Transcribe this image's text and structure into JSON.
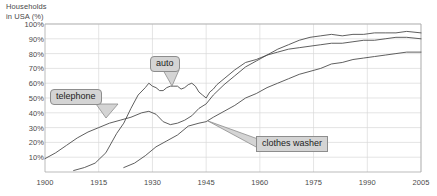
{
  "chart_data": {
    "type": "line",
    "title": "Households\nin USA (%)",
    "ylabel": "Households in USA (%)",
    "xlabel": "",
    "xlim": [
      1900,
      2005
    ],
    "ylim": [
      0,
      100
    ],
    "grid": true,
    "legend_position": "inline-callouts",
    "y_ticks": [
      "10%",
      "20%",
      "30%",
      "40%",
      "50%",
      "60%",
      "70%",
      "80%",
      "90%",
      "100%"
    ],
    "y_tick_values": [
      10,
      20,
      30,
      40,
      50,
      60,
      70,
      80,
      90,
      100
    ],
    "x_ticks": [
      "1900",
      "1915",
      "1930",
      "1945",
      "1960",
      "1975",
      "1990",
      "2005"
    ],
    "x_tick_values": [
      1900,
      1915,
      1930,
      1945,
      1960,
      1975,
      1990,
      2005
    ],
    "annotations": [
      {
        "label": "telephone",
        "series": "telephone",
        "point_x": 1925,
        "point_y": 38
      },
      {
        "label": "auto",
        "series": "auto",
        "point_x": 1937,
        "point_y": 56
      },
      {
        "label": "clothes washer",
        "series": "clothes washer",
        "point_x": 1965,
        "point_y": 50
      }
    ],
    "series": [
      {
        "name": "telephone",
        "color": "#4d4d4d",
        "points": [
          [
            1900,
            9
          ],
          [
            1903,
            13
          ],
          [
            1906,
            18
          ],
          [
            1909,
            23
          ],
          [
            1912,
            27
          ],
          [
            1915,
            30
          ],
          [
            1918,
            33
          ],
          [
            1921,
            35
          ],
          [
            1924,
            37
          ],
          [
            1927,
            40
          ],
          [
            1929,
            41
          ],
          [
            1931,
            39
          ],
          [
            1933,
            34
          ],
          [
            1935,
            32
          ],
          [
            1937,
            33
          ],
          [
            1939,
            35
          ],
          [
            1941,
            38
          ],
          [
            1943,
            43
          ],
          [
            1945,
            46
          ],
          [
            1947,
            52
          ],
          [
            1950,
            59
          ],
          [
            1953,
            65
          ],
          [
            1956,
            71
          ],
          [
            1959,
            75
          ],
          [
            1962,
            79
          ],
          [
            1965,
            83
          ],
          [
            1968,
            86
          ],
          [
            1971,
            89
          ],
          [
            1974,
            91
          ],
          [
            1977,
            92
          ],
          [
            1980,
            93
          ],
          [
            1983,
            92
          ],
          [
            1986,
            93
          ],
          [
            1989,
            93
          ],
          [
            1992,
            94
          ],
          [
            1995,
            94
          ],
          [
            1998,
            94
          ],
          [
            2001,
            95
          ],
          [
            2005,
            94
          ]
        ]
      },
      {
        "name": "auto",
        "color": "#4d4d4d",
        "points": [
          [
            1908,
            1
          ],
          [
            1911,
            3
          ],
          [
            1914,
            6
          ],
          [
            1917,
            13
          ],
          [
            1920,
            26
          ],
          [
            1922,
            33
          ],
          [
            1924,
            43
          ],
          [
            1926,
            52
          ],
          [
            1928,
            57
          ],
          [
            1929,
            60
          ],
          [
            1930,
            58
          ],
          [
            1931,
            57
          ],
          [
            1932,
            55
          ],
          [
            1933,
            55
          ],
          [
            1934,
            57
          ],
          [
            1935,
            58
          ],
          [
            1936,
            58
          ],
          [
            1937,
            58
          ],
          [
            1938,
            56
          ],
          [
            1939,
            57
          ],
          [
            1940,
            59
          ],
          [
            1941,
            60
          ],
          [
            1942,
            58
          ],
          [
            1943,
            54
          ],
          [
            1944,
            52
          ],
          [
            1945,
            50
          ],
          [
            1946,
            54
          ],
          [
            1947,
            56
          ],
          [
            1948,
            59
          ],
          [
            1950,
            63
          ],
          [
            1953,
            69
          ],
          [
            1956,
            74
          ],
          [
            1959,
            76
          ],
          [
            1962,
            79
          ],
          [
            1965,
            81
          ],
          [
            1968,
            83
          ],
          [
            1971,
            84
          ],
          [
            1974,
            85
          ],
          [
            1977,
            86
          ],
          [
            1980,
            87
          ],
          [
            1983,
            87
          ],
          [
            1986,
            88
          ],
          [
            1989,
            89
          ],
          [
            1992,
            89
          ],
          [
            1995,
            90
          ],
          [
            1998,
            91
          ],
          [
            2001,
            91
          ],
          [
            2005,
            90
          ]
        ]
      },
      {
        "name": "clothes washer",
        "color": "#4d4d4d",
        "points": [
          [
            1922,
            3
          ],
          [
            1925,
            6
          ],
          [
            1928,
            11
          ],
          [
            1931,
            17
          ],
          [
            1934,
            21
          ],
          [
            1937,
            25
          ],
          [
            1940,
            31
          ],
          [
            1943,
            33
          ],
          [
            1945,
            34
          ],
          [
            1947,
            37
          ],
          [
            1950,
            41
          ],
          [
            1953,
            45
          ],
          [
            1956,
            50
          ],
          [
            1959,
            53
          ],
          [
            1962,
            57
          ],
          [
            1965,
            60
          ],
          [
            1968,
            63
          ],
          [
            1971,
            66
          ],
          [
            1974,
            68
          ],
          [
            1977,
            70
          ],
          [
            1980,
            73
          ],
          [
            1983,
            74
          ],
          [
            1986,
            76
          ],
          [
            1989,
            77
          ],
          [
            1992,
            78
          ],
          [
            1995,
            79
          ],
          [
            1998,
            80
          ],
          [
            2001,
            81
          ],
          [
            2005,
            81
          ]
        ]
      }
    ]
  },
  "labels": {
    "telephone": "telephone",
    "auto": "auto",
    "clothes_washer": "clothes washer"
  },
  "colors": {
    "line": "#4d4d4d",
    "grid": "#d9d9d9",
    "axis": "#aaaaaa",
    "text": "#4a4a4a",
    "callout_bg": "#d4d4d4",
    "callout_border": "#8d8d8d"
  }
}
